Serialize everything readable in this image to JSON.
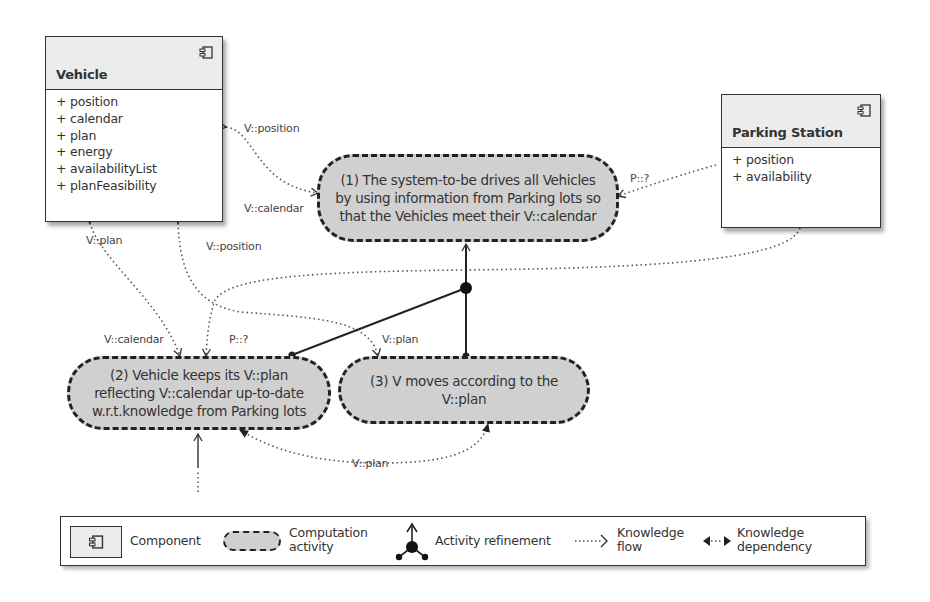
{
  "components": {
    "vehicle": {
      "title": "Vehicle",
      "attributes": [
        "+ position",
        "+ calendar",
        "+ plan",
        "+ energy",
        "+ availabilityList",
        "+ planFeasibility"
      ]
    },
    "parking_station": {
      "title": "Parking Station",
      "attributes": [
        "+ position",
        "+ availability"
      ]
    }
  },
  "activities": {
    "a1": {
      "text": "(1) The system-to-be drives all Vehicles\nby using information from Parking lots so\nthat the Vehicles meet their V::calendar"
    },
    "a2": {
      "text": "(2) Vehicle keeps its V::plan\nreflecting V::calendar up-to-date\nw.r.t.knowledge from Parking lots"
    },
    "a3": {
      "text": "(3) V moves according to the\nV::plan"
    }
  },
  "edge_labels": {
    "v_position_top": "V::position",
    "v_calendar_top": "V::calendar",
    "p_q_top": "P::?",
    "v_plan_left": "V::plan",
    "v_position_mid": "V::position",
    "v_calendar_mid": "V::calendar",
    "p_q_mid": "P::?",
    "v_plan_mid": "V::plan",
    "v_plan_bottom": "V::plan"
  },
  "legend": {
    "component": "Component",
    "computation_activity": "Computation\nactivity",
    "activity_refinement": "Activity refinement",
    "knowledge_flow": "Knowledge\nflow",
    "knowledge_dependency": "Knowledge\ndependency"
  },
  "colors": {
    "activity_fill": "#d0d0d0",
    "component_header": "#ececec",
    "stroke": "#222222"
  }
}
